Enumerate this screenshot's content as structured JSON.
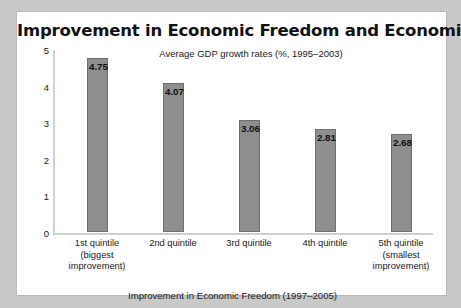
{
  "card": {
    "title": "Improvement in Economic Freedom and Economic Growth",
    "subtitle": "Average GDP growth rates (%, 1995–2003)",
    "xaxis_title": "Improvement in Economic Freedom (1997–2005)"
  },
  "colors": {
    "page_background": "#c9c9c9",
    "card_background": "#ffffff",
    "bar_fill": "#8e8e8e",
    "bar_stroke": "#6f6f6f",
    "axis_line": "#d0d0d0",
    "text": "#1a1a1a"
  },
  "chart_data": {
    "type": "bar",
    "title": "Improvement in Economic Freedom and Economic Growth",
    "subtitle": "Average GDP growth rates (%, 1995–2003)",
    "xlabel": "Improvement in Economic Freedom (1997–2005)",
    "ylabel": "",
    "ylim": [
      0,
      5
    ],
    "yticks": [
      "0",
      "1",
      "2",
      "3",
      "4",
      "5"
    ],
    "grid": false,
    "legend": false,
    "categories": [
      "1st quintile (biggest improvement)",
      "2nd quintile",
      "3rd quintile",
      "4th quintile",
      "5th quintile (smallest improvement)"
    ],
    "category_lines": [
      [
        "1st quintile",
        "(biggest",
        "improvement)"
      ],
      [
        "2nd quintile"
      ],
      [
        "3rd quintile"
      ],
      [
        "4th quintile"
      ],
      [
        "5th quintile",
        "(smallest",
        "improvement)"
      ]
    ],
    "values": [
      4.75,
      4.07,
      3.06,
      2.81,
      2.68
    ],
    "value_labels": [
      "4.75",
      "4.07",
      "3.06",
      "2.81",
      "2.68"
    ]
  }
}
